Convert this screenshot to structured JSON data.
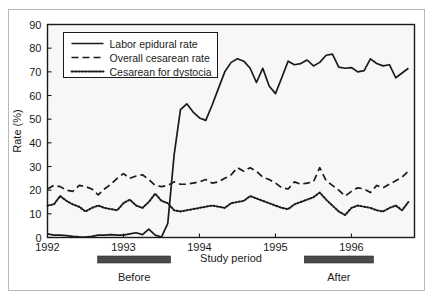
{
  "figure": {
    "title_visible": false,
    "background_color": "#ffffff",
    "plot_background_color": "#f7f7f7",
    "line_color": "#1a1a1a",
    "bar_color": "#4a4a4a"
  },
  "annotations": {
    "study_period_label": "Study period",
    "before_label": "Before",
    "after_label": "After"
  },
  "chart_data": {
    "type": "line",
    "title": "",
    "subtitle": "",
    "xlabel": "Study period",
    "ylabel": "Rate (%)",
    "ylim": [
      0,
      90
    ],
    "yticks": [
      0,
      10,
      20,
      30,
      40,
      50,
      60,
      70,
      80,
      90
    ],
    "ytick_labels": [
      "0",
      "10",
      "20",
      "30",
      "40",
      "50",
      "60",
      "70",
      "80",
      "90"
    ],
    "xlim": [
      1992.0,
      1996.83
    ],
    "xticks": [
      1992,
      1993,
      1994,
      1995,
      1996
    ],
    "xtick_labels": [
      "1992",
      "1993",
      "1994",
      "1995",
      "1996"
    ],
    "grid": false,
    "legend_position": "upper left",
    "x": [
      1992.0,
      1992.083,
      1992.167,
      1992.25,
      1992.333,
      1992.417,
      1992.5,
      1992.583,
      1992.667,
      1992.75,
      1992.833,
      1992.917,
      1993.0,
      1993.083,
      1993.167,
      1993.25,
      1993.333,
      1993.417,
      1993.5,
      1993.583,
      1993.667,
      1993.75,
      1993.833,
      1993.917,
      1994.0,
      1994.083,
      1994.167,
      1994.25,
      1994.333,
      1994.417,
      1994.5,
      1994.583,
      1994.667,
      1994.75,
      1994.833,
      1994.917,
      1995.0,
      1995.083,
      1995.167,
      1995.25,
      1995.333,
      1995.417,
      1995.5,
      1995.583,
      1995.667,
      1995.75,
      1995.833,
      1995.917,
      1996.0,
      1996.083,
      1996.167,
      1996.25,
      1996.333,
      1996.417,
      1996.5,
      1996.583,
      1996.667,
      1996.75
    ],
    "series": [
      {
        "name": "Labor epidural rate",
        "style": "solid",
        "values": [
          1.5,
          1.0,
          1.0,
          0.8,
          0.5,
          0.3,
          0.2,
          0.5,
          1.0,
          1.0,
          1.2,
          1.0,
          1.0,
          1.5,
          2.0,
          1.2,
          3.5,
          1.0,
          0.2,
          6.0,
          35.0,
          54.0,
          56.5,
          53.0,
          50.5,
          49.5,
          56.0,
          63.0,
          70.0,
          74.0,
          75.5,
          74.5,
          71.5,
          65.5,
          71.5,
          64.0,
          60.8,
          67.5,
          74.5,
          73.0,
          73.5,
          75.0,
          72.5,
          74.0,
          77.0,
          77.5,
          72.0,
          71.5,
          71.8,
          70.0,
          70.5,
          75.5,
          73.5,
          72.5,
          73.0,
          67.5,
          69.5,
          71.5
        ]
      },
      {
        "name": "Overall cesarean rate",
        "style": "dashed",
        "values": [
          20.5,
          22.0,
          21.5,
          20.0,
          19.5,
          22.0,
          21.5,
          20.5,
          18.0,
          20.5,
          22.5,
          25.0,
          27.0,
          25.0,
          26.0,
          26.5,
          24.5,
          22.0,
          21.5,
          22.0,
          23.5,
          22.5,
          22.5,
          23.0,
          23.5,
          24.5,
          23.0,
          23.5,
          25.0,
          26.5,
          29.5,
          28.0,
          29.5,
          28.0,
          25.5,
          24.5,
          23.0,
          21.0,
          20.5,
          23.5,
          22.5,
          23.0,
          23.5,
          29.5,
          24.0,
          22.0,
          20.0,
          17.5,
          19.5,
          21.0,
          20.5,
          19.0,
          22.0,
          21.0,
          22.5,
          24.0,
          25.5,
          28.0
        ]
      },
      {
        "name": "Cesarean for dystocia",
        "style": "dotted",
        "values": [
          13.5,
          14.0,
          17.5,
          15.5,
          14.0,
          13.0,
          11.0,
          12.5,
          13.5,
          12.5,
          12.0,
          11.5,
          14.5,
          16.0,
          13.5,
          12.5,
          15.0,
          18.5,
          15.5,
          14.5,
          11.5,
          11.0,
          11.5,
          12.0,
          12.5,
          13.0,
          13.5,
          13.0,
          12.5,
          14.5,
          15.0,
          15.5,
          17.5,
          16.5,
          15.5,
          14.5,
          13.5,
          12.5,
          12.0,
          14.0,
          15.0,
          16.0,
          17.0,
          19.0,
          16.0,
          13.5,
          11.0,
          9.5,
          12.5,
          13.5,
          13.0,
          12.5,
          11.5,
          11.0,
          12.5,
          13.5,
          11.5,
          15.0
        ]
      }
    ]
  },
  "period_bars": [
    {
      "name": "before",
      "x_start": 1992.66,
      "x_end": 1993.62
    },
    {
      "name": "after",
      "x_start": 1995.38,
      "x_end": 1996.29
    }
  ]
}
